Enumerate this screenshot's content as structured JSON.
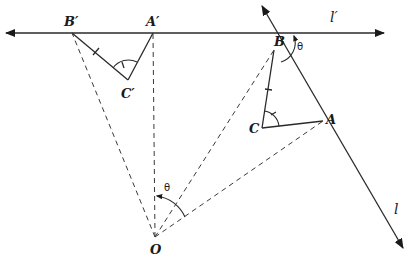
{
  "figure": {
    "points": {
      "B_prime": "B′",
      "A_prime": "A′",
      "C_prime": "C′",
      "B": "B",
      "A": "A",
      "C": "C",
      "O": "O"
    },
    "lines": {
      "l_prime": "l′",
      "l": "l"
    },
    "angles": {
      "theta_at_B": "θ",
      "theta_at_O": "θ"
    }
  }
}
